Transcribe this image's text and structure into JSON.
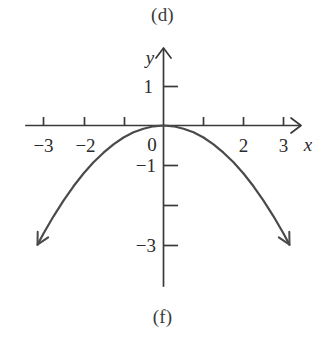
{
  "figure": {
    "caption_top": "(d)",
    "caption_bottom": "(f)",
    "axis_color": "#3a3a3a",
    "curve_color": "#4a4a4a",
    "background": "#ffffff"
  },
  "chart_data": {
    "type": "line",
    "title": "",
    "subtitle": "",
    "xlabel": "x",
    "ylabel": "y",
    "function": "y = -0.3x^2",
    "xlim": [
      -3.6,
      3.6
    ],
    "ylim": [
      -3.5,
      1.6
    ],
    "grid": false,
    "legend": null,
    "x_ticks": [
      -3,
      -2,
      -1,
      1,
      2,
      3
    ],
    "x_tick_labels": [
      "-3",
      "-2",
      "",
      "",
      "2",
      "3"
    ],
    "y_ticks": [
      1,
      -1,
      -2,
      -3
    ],
    "y_tick_labels": [
      "1",
      "-1",
      "",
      "-3"
    ],
    "origin_label": "0",
    "x_axis_arrow": true,
    "y_axis_arrow": true,
    "curve_arrow_start": true,
    "curve_arrow_end": true,
    "x": [
      -3.15,
      -3.0,
      -2.75,
      -2.5,
      -2.25,
      -2.0,
      -1.75,
      -1.5,
      -1.25,
      -1.0,
      -0.75,
      -0.5,
      -0.25,
      0,
      0.25,
      0.5,
      0.75,
      1.0,
      1.25,
      1.5,
      1.75,
      2.0,
      2.25,
      2.5,
      2.75,
      3.0,
      3.15
    ],
    "y": [
      -2.98,
      -2.7,
      -2.27,
      -1.88,
      -1.52,
      -1.2,
      -0.92,
      -0.68,
      -0.47,
      -0.3,
      -0.17,
      -0.08,
      -0.02,
      0,
      -0.02,
      -0.08,
      -0.17,
      -0.3,
      -0.47,
      -0.68,
      -0.92,
      -1.2,
      -1.52,
      -1.88,
      -2.27,
      -2.7,
      -2.98
    ]
  },
  "labels": {
    "x_neg3": "−3",
    "x_neg2": "−2",
    "x_pos2": "2",
    "x_pos3": "3",
    "y_pos1": "1",
    "y_neg1": "−1",
    "y_neg3": "−3",
    "origin": "0",
    "x_axis": "x",
    "y_axis": "y"
  }
}
